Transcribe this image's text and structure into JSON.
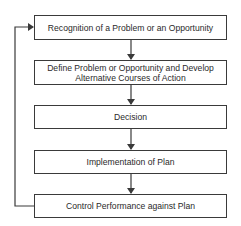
{
  "diagram": {
    "title_partial": "Figure — Decision-Making Process",
    "steps": [
      {
        "label": "Recognition of a Problem or an Opportunity"
      },
      {
        "label": "Define Problem or Opportunity and Develop Alternative Courses of Action"
      },
      {
        "label": "Decision"
      },
      {
        "label": "Implementation of Plan"
      },
      {
        "label": "Control Performance against Plan"
      }
    ],
    "connections": [
      {
        "from": 0,
        "to": 1
      },
      {
        "from": 1,
        "to": 2
      },
      {
        "from": 2,
        "to": 3
      },
      {
        "from": 3,
        "to": 4
      },
      {
        "from": 4,
        "to": 0,
        "type": "feedback-loop"
      }
    ],
    "colors": {
      "line": "#3a3a3a",
      "background": "#ffffff"
    }
  }
}
